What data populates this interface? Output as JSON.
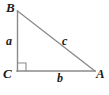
{
  "figure": {
    "type": "right-triangle-geometry-diagram",
    "background_color": "#ffffff",
    "stroke_color": "#8a8a8a",
    "label_color": "#1a1a1a",
    "stroke_width": 1.4
  },
  "vertices": [
    {
      "id": "B",
      "label": "B",
      "x": 17,
      "y": 11,
      "label_x": 6,
      "label_y": 1
    },
    {
      "id": "C",
      "label": "C",
      "x": 17,
      "y": 71,
      "label_x": 3,
      "label_y": 67
    },
    {
      "id": "A",
      "label": "A",
      "x": 95,
      "y": 71,
      "label_x": 96,
      "label_y": 67
    }
  ],
  "sides": [
    {
      "id": "a",
      "label": "a",
      "from": "B",
      "to": "C",
      "role": "vertical-leg",
      "label_x": 6,
      "label_y": 35
    },
    {
      "id": "b",
      "label": "b",
      "from": "C",
      "to": "A",
      "role": "horizontal-leg",
      "label_x": 57,
      "label_y": 72
    },
    {
      "id": "c",
      "label": "c",
      "from": "B",
      "to": "A",
      "role": "hypotenuse",
      "label_x": 62,
      "label_y": 35
    }
  ],
  "right_angle": {
    "at_vertex": "C",
    "marker": "square",
    "size": 8,
    "x": 18,
    "y": 63
  }
}
